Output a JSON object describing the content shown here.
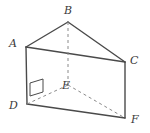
{
  "figure": {
    "kind": "geometry-diagram",
    "background_color": "#ffffff",
    "stroke_color": "#4a4a4a",
    "hidden_stroke_color": "#8a8a8a",
    "label_color": "#3a3a3a",
    "width": 150,
    "height": 133,
    "labels": {
      "A": "A",
      "B": "B",
      "C": "C",
      "D": "D",
      "E": "E",
      "F": "F"
    },
    "label_positions": {
      "A": {
        "x": 9,
        "y": 38
      },
      "B": {
        "x": 64,
        "y": 5
      },
      "C": {
        "x": 130,
        "y": 55
      },
      "D": {
        "x": 9,
        "y": 100
      },
      "E": {
        "x": 62,
        "y": 80
      },
      "F": {
        "x": 131,
        "y": 114
      }
    },
    "vertices": {
      "A": {
        "x": 26,
        "y": 47
      },
      "B": {
        "x": 68,
        "y": 22
      },
      "C": {
        "x": 125,
        "y": 62
      },
      "D": {
        "x": 27,
        "y": 104
      },
      "E": {
        "x": 68,
        "y": 85
      },
      "F": {
        "x": 125,
        "y": 118
      }
    },
    "visible_edges": [
      {
        "name": "edge-AB",
        "from": "A",
        "to": "B"
      },
      {
        "name": "edge-BC",
        "from": "B",
        "to": "C"
      },
      {
        "name": "edge-AC",
        "from": "A",
        "to": "C"
      },
      {
        "name": "edge-AD",
        "from": "A",
        "to": "D"
      },
      {
        "name": "edge-CF",
        "from": "C",
        "to": "F"
      },
      {
        "name": "edge-DF",
        "from": "D",
        "to": "F"
      }
    ],
    "hidden_edges": [
      {
        "name": "edge-BE",
        "from": "B",
        "to": "E"
      },
      {
        "name": "edge-DE",
        "from": "D",
        "to": "E"
      },
      {
        "name": "edge-EF",
        "from": "E",
        "to": "F"
      }
    ],
    "right_angle_mark": {
      "name": "right-angle-at-D",
      "at": "D",
      "points": "30,83 43,79 43,92 30,96"
    }
  }
}
